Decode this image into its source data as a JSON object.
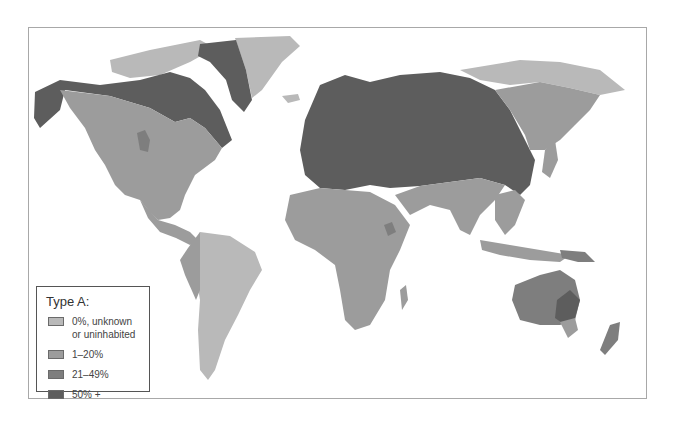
{
  "map": {
    "title": "Type A blood distribution",
    "colors": {
      "ocean": "#ffffff",
      "level0": "#b9b9b9",
      "level1": "#9c9c9c",
      "level2": "#7e7e7e",
      "level3": "#5d5d5d",
      "frame": "#a8a8a8"
    }
  },
  "legend": {
    "title": "Type A:",
    "items": [
      {
        "label": "0%, unknown or uninhabited",
        "color": "#b9b9b9"
      },
      {
        "label": "1–20%",
        "color": "#9c9c9c"
      },
      {
        "label": "21–49%",
        "color": "#7e7e7e"
      },
      {
        "label": "50% +",
        "color": "#5d5d5d"
      }
    ]
  }
}
